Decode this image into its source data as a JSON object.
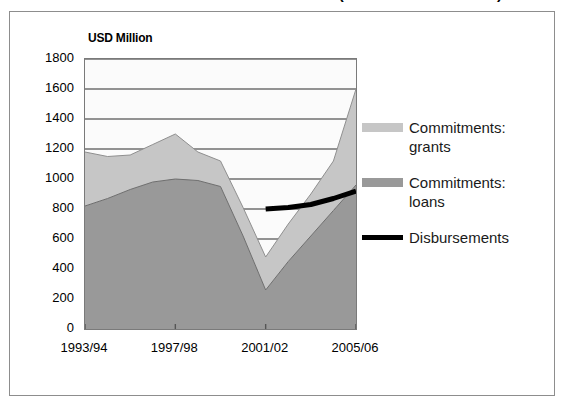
{
  "title": {
    "text": "Aid Commitments and Disbursements (millions of US dollars)",
    "visible_fragment": "(millions of US dollars)"
  },
  "units_label": "USD Million",
  "legend": {
    "entries": [
      {
        "label": "Commitments:\ngrants",
        "color": "#c6c6c6",
        "swatch": "area-swatch-grants"
      },
      {
        "label": "Commitments:\nloans",
        "color": "#999999",
        "swatch": "area-swatch-loans"
      },
      {
        "label": "Disbursements",
        "color": "#000000",
        "swatch": "line-swatch-disbursements"
      }
    ]
  },
  "chart_data": {
    "type": "area",
    "stacked": true,
    "title": "Aid Commitments and Disbursements",
    "xlabel": "",
    "ylabel": "USD Million",
    "ylim": [
      0,
      1800
    ],
    "ytick_step": 200,
    "yticks": [
      1800,
      1600,
      1400,
      1200,
      1000,
      800,
      600,
      400,
      200,
      0
    ],
    "grid": true,
    "grid_axis": "y",
    "legend_position": "right",
    "x": [
      "1993/94",
      "1994/95",
      "1995/96",
      "1996/97",
      "1997/98",
      "1998/99",
      "1999/00",
      "2000/01",
      "2001/02",
      "2002/03",
      "2003/04",
      "2004/05",
      "2005/06"
    ],
    "xtick_labels": [
      "1993/94",
      "1997/98",
      "2001/02",
      "2005/06"
    ],
    "xtick_indices": [
      0,
      4,
      8,
      12
    ],
    "series": [
      {
        "name": "Commitments: loans",
        "color": "#999999",
        "values": [
          820,
          870,
          930,
          980,
          1000,
          990,
          950,
          620,
          260,
          450,
          620,
          790,
          960
        ]
      },
      {
        "name": "Commitments: grants",
        "color": "#c6c6c6",
        "values": [
          360,
          280,
          230,
          250,
          300,
          190,
          170,
          190,
          220,
          250,
          280,
          330,
          640
        ]
      },
      {
        "name": "Disbursements",
        "color": "#000000",
        "type": "line",
        "x": [
          "2001/02",
          "2002/03",
          "2003/04",
          "2004/05",
          "2005/06"
        ],
        "values": [
          800,
          810,
          830,
          870,
          920
        ]
      }
    ],
    "totals": [
      1180,
      1150,
      1160,
      1230,
      1300,
      1180,
      1120,
      810,
      480,
      700,
      900,
      1120,
      1600
    ]
  },
  "colors": {
    "grants_area": "#c6c6c6",
    "loans_area": "#999999",
    "disbursements_line": "#000000",
    "gridline": "#6f6f6f",
    "axis": "#7a7a7a",
    "frame": "#8d8d8d",
    "plot_background": "#fbfbfb",
    "text": "#000000"
  }
}
